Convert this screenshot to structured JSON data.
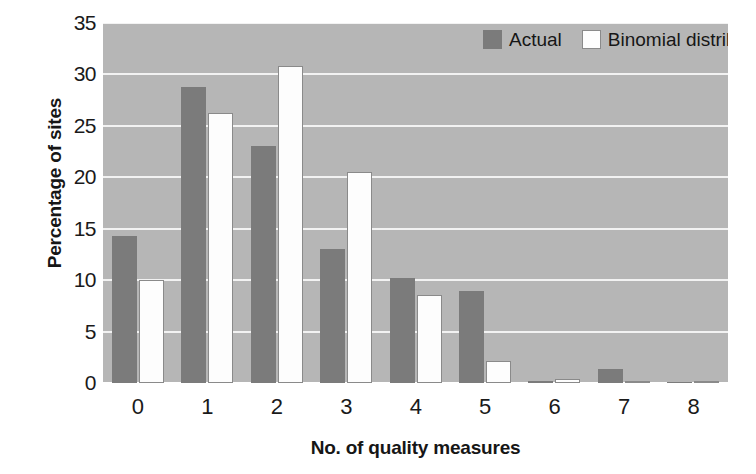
{
  "chart_data": {
    "type": "bar",
    "title": "",
    "xlabel": "No. of quality measures",
    "ylabel": "Percentage of sites",
    "categories": [
      "0",
      "1",
      "2",
      "3",
      "4",
      "5",
      "6",
      "7",
      "8"
    ],
    "series": [
      {
        "name": "Actual",
        "color": "#7b7b7b",
        "values": [
          14.3,
          28.8,
          23.0,
          13.0,
          10.2,
          8.9,
          0.2,
          1.4,
          0.1
        ]
      },
      {
        "name": "Binomial distribution",
        "color": "#ffffff",
        "values": [
          10.0,
          26.3,
          30.8,
          20.5,
          8.6,
          2.1,
          0.35,
          0.1,
          0.05
        ]
      }
    ],
    "ylim": [
      0,
      35
    ],
    "ytick_labels": [
      "0",
      "5",
      "10",
      "15",
      "20",
      "25",
      "30",
      "35"
    ],
    "ytick_values": [
      0,
      5,
      10,
      15,
      20,
      25,
      30,
      35
    ],
    "grid": true,
    "grid_axis": "y",
    "legend_position": "top-right-inside",
    "plot_background": "#b6b6b6",
    "gridline_color": "#f2f2f2",
    "figure_background": "#ffffff"
  },
  "legend": {
    "entries": [
      {
        "label": "Actual",
        "swatch": "legend-swatch-actual"
      },
      {
        "label": "Binomial distribution",
        "swatch": "legend-swatch-binomial"
      }
    ]
  },
  "axes": {
    "x_title": "No. of quality measures",
    "y_title": "Percentage of sites"
  }
}
